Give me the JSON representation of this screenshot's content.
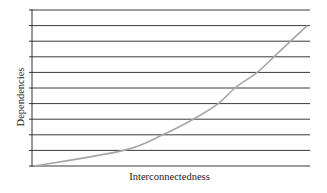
{
  "chart_data": {
    "type": "line",
    "title": "",
    "xlabel": "Interconnectedness",
    "ylabel": "Dependencies",
    "x_ticks_labeled": false,
    "y_ticks_labeled": false,
    "grid": {
      "horizontal": true,
      "vertical": false,
      "horizontal_lines": 11
    },
    "xlim": [
      0,
      1
    ],
    "ylim": [
      0,
      10
    ],
    "legend": null,
    "series": [
      {
        "name": "Dependencies vs Interconnectedness",
        "color": "#a6a6a6",
        "x": [
          0.01,
          0.33,
          0.47,
          0.58,
          0.67,
          0.73,
          0.81,
          0.87,
          0.93,
          0.99
        ],
        "y": [
          0,
          1,
          2,
          3,
          4,
          5,
          6,
          7,
          8,
          9
        ]
      }
    ]
  },
  "colors": {
    "grid": "#3a3a3a",
    "axis": "#333333",
    "curve": "#a6a6a6",
    "text": "#222222"
  }
}
